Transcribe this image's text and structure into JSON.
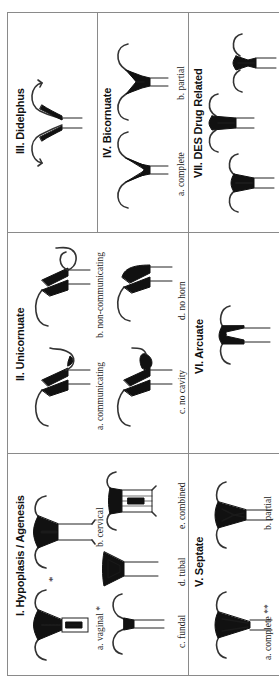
{
  "figure": {
    "orientation": "rotated 90deg counter-clockwise",
    "grid": {
      "rows": 3,
      "columns": 3
    },
    "sections": [
      {
        "id": "I",
        "title": "I. Hypoplasis / Agenesis",
        "subtypes": [
          {
            "label": "a. vaginal *"
          },
          {
            "label": "b. cervical"
          },
          {
            "label": "c. fundal"
          },
          {
            "label": "d. tubal"
          },
          {
            "label": "e. combined"
          }
        ]
      },
      {
        "id": "II",
        "title": "II. Unicornuate",
        "subtypes": [
          {
            "label": "a. communicating"
          },
          {
            "label": "b. non-communicating"
          },
          {
            "label": "c. no cavity"
          },
          {
            "label": "d. no horn"
          }
        ]
      },
      {
        "id": "III",
        "title": "III. Didelphus",
        "subtypes": []
      },
      {
        "id": "IV",
        "title": "IV. Bicornuate",
        "subtypes": [
          {
            "label": "a. complete"
          },
          {
            "label": "b. partial"
          }
        ]
      },
      {
        "id": "V",
        "title": "V. Septate",
        "subtypes": [
          {
            "label": "a. complete **"
          },
          {
            "label": "b. partial"
          }
        ]
      },
      {
        "id": "VI",
        "title": "VI. Arcuate",
        "subtypes": []
      },
      {
        "id": "VII",
        "title": "VII. DES Drug Related",
        "subtypes": []
      }
    ],
    "annotations": {
      "asterisk_mark": "*"
    },
    "colors": {
      "border": "#8a8a8a",
      "ink": "#111111",
      "background": "#ffffff"
    }
  }
}
